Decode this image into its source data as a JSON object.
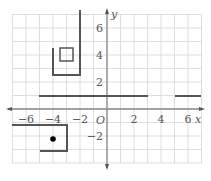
{
  "chart_data": {
    "type": "coordinate-grid",
    "title": "",
    "xlabel": "x",
    "ylabel": "y",
    "origin_label": "O",
    "xlim": [
      -7,
      7
    ],
    "ylim": [
      -4,
      7
    ],
    "grid": true,
    "x_ticks": [
      "-6",
      "-4",
      "-2",
      "2",
      "4",
      "6"
    ],
    "y_ticks": [
      "6",
      "4",
      "2",
      "-2"
    ],
    "shapes": [
      {
        "name": "open-bracket-shape",
        "type": "polyline",
        "points": [
          [
            -2,
            7.3
          ],
          [
            -2,
            2.5
          ],
          [
            -4,
            2.5
          ],
          [
            -4,
            4.5
          ]
        ]
      },
      {
        "name": "small-square",
        "type": "polygon",
        "points": [
          [
            -3.5,
            4.5
          ],
          [
            -2.5,
            4.5
          ],
          [
            -2.5,
            3.5
          ],
          [
            -3.5,
            3.5
          ]
        ]
      },
      {
        "name": "horizontal-segment-1",
        "type": "line",
        "points": [
          [
            -5,
            1
          ],
          [
            3,
            1
          ]
        ]
      },
      {
        "name": "horizontal-segment-2",
        "type": "line",
        "points": [
          [
            5,
            1
          ],
          [
            7,
            1
          ]
        ]
      },
      {
        "name": "lower-bracket-shape",
        "type": "polyline",
        "points": [
          [
            -7,
            -1
          ],
          [
            -3,
            -1
          ],
          [
            -3,
            -3
          ],
          [
            -5,
            -3
          ]
        ]
      },
      {
        "name": "point",
        "type": "point",
        "points": [
          [
            -4,
            -2
          ]
        ]
      }
    ]
  },
  "labels": {
    "x_axis": "x",
    "y_axis": "y",
    "origin": "O",
    "x_ticks": [
      {
        "text": "−6",
        "x": 26
      },
      {
        "text": "−4",
        "x": 53
      },
      {
        "text": "−2",
        "x": 80
      },
      {
        "text": "2",
        "x": 134
      },
      {
        "text": "4",
        "x": 161
      },
      {
        "text": "6",
        "x": 188
      }
    ],
    "y_ticks": [
      {
        "text": "6",
        "y": 28
      },
      {
        "text": "4",
        "y": 55
      },
      {
        "text": "2",
        "y": 82
      },
      {
        "text": "−2",
        "y": 136
      }
    ]
  },
  "colors": {
    "grid": "#d6d6d6",
    "axis": "#888888",
    "shape": "#555555",
    "point": "#000000"
  }
}
